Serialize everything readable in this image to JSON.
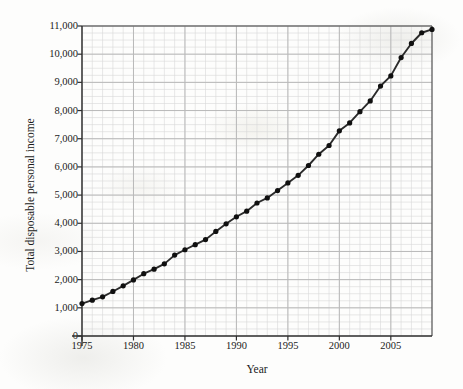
{
  "chart_data": {
    "type": "line",
    "title": "",
    "xlabel": "Year",
    "ylabel": "Total disposable personal income",
    "xlim": [
      1975,
      2009
    ],
    "ylim": [
      0,
      11000
    ],
    "grid": true,
    "legend": "none",
    "x_ticks": [
      "1975",
      "1980",
      "1985",
      "1990",
      "1995",
      "2000",
      "2005"
    ],
    "x_tick_values": [
      1975,
      1980,
      1985,
      1990,
      1995,
      2000,
      2005
    ],
    "y_ticks": [
      "0",
      "1,000",
      "2,000",
      "3,000",
      "4,000",
      "5,000",
      "6,000",
      "7,000",
      "8,000",
      "9,000",
      "10,000",
      "11,000"
    ],
    "y_tick_values": [
      0,
      1000,
      2000,
      3000,
      4000,
      5000,
      6000,
      7000,
      8000,
      9000,
      10000,
      11000
    ],
    "x": [
      1975,
      1976,
      1977,
      1978,
      1979,
      1980,
      1981,
      1982,
      1983,
      1984,
      1985,
      1986,
      1987,
      1988,
      1989,
      1990,
      1991,
      1992,
      1993,
      1994,
      1995,
      1996,
      1997,
      1998,
      1999,
      2000,
      2001,
      2002,
      2003,
      2004,
      2005,
      2006,
      2007,
      2008,
      2009
    ],
    "values": [
      1150,
      1270,
      1390,
      1580,
      1780,
      1990,
      2210,
      2370,
      2560,
      2870,
      3060,
      3240,
      3420,
      3710,
      3980,
      4230,
      4430,
      4720,
      4900,
      5160,
      5430,
      5700,
      6050,
      6450,
      6760,
      7280,
      7560,
      7960,
      8340,
      8870,
      9230,
      9880,
      10380,
      10760,
      10880
    ],
    "marker": "circle",
    "line_color": "#2b2b2b",
    "marker_color": "#101010",
    "grid_color": "#b9b9b9",
    "minor_grid_color": "#d8d8d8",
    "axis_color": "#4a4a4a"
  }
}
